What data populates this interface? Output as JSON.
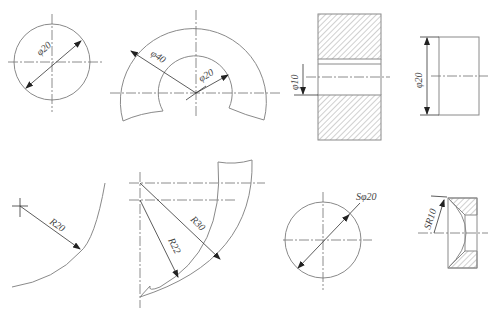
{
  "figure": {
    "caption": "",
    "colors": {
      "outline": "#8a8a8a",
      "centerline": "#6e6e6e",
      "dimension": "#333333",
      "text": "#444444"
    }
  },
  "views": [
    {
      "id": "circle-diameter",
      "label": "φ20"
    },
    {
      "id": "partial-ring",
      "outer_label": "φ40",
      "inner_label": "φ20"
    },
    {
      "id": "hole-section",
      "label": "φ10"
    },
    {
      "id": "cylinder-side",
      "label": "φ20"
    },
    {
      "id": "large-radius-arc",
      "label": "R20"
    },
    {
      "id": "curved-band",
      "outer_label": "R30",
      "inner_label": "R22"
    },
    {
      "id": "sphere",
      "label": "Sφ20"
    },
    {
      "id": "spherical-seat",
      "label": "SR10"
    }
  ]
}
